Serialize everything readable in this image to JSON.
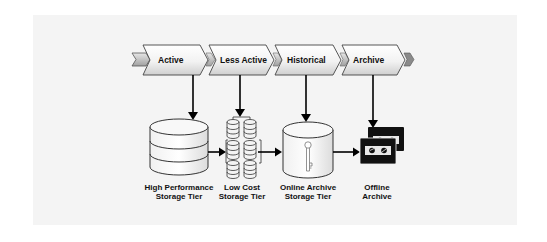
{
  "diagram": {
    "title": "",
    "phases": [
      {
        "label": "Active"
      },
      {
        "label": "Less Active"
      },
      {
        "label": "Historical"
      },
      {
        "label": "Archive"
      }
    ],
    "tiers": [
      {
        "line1": "High Performance",
        "line2": "Storage Tier",
        "icon": "database-cylinder-icon"
      },
      {
        "line1": "Low Cost",
        "line2": "Storage Tier",
        "icon": "disk-stack-array-icon"
      },
      {
        "line1": "Online Archive",
        "line2": "Storage Tier",
        "icon": "key-cylinder-icon"
      },
      {
        "line1": "Offline",
        "line2": "Archive",
        "icon": "tape-cartridges-icon"
      }
    ],
    "colors": {
      "panel": "#f4f4f4",
      "chevron_fill_top": "#ffffff",
      "chevron_fill_bottom": "#d4d4d4",
      "chevron_stroke": "#444444",
      "connector_tab": "#a8a8a8",
      "arrow": "#000000"
    }
  }
}
